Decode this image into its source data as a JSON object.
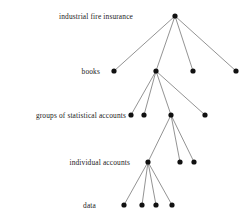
{
  "figure": {
    "type": "hierarchy-tree-diagram",
    "width": 244,
    "height": 221,
    "background_color": "#ffffff",
    "node_color": "#111111",
    "edge_color": "#4a4a4a"
  },
  "levels": [
    {
      "id": "level-1",
      "label": "industrial fire insurance",
      "label_x": 133,
      "label_y": 16
    },
    {
      "id": "level-2",
      "label": "books",
      "label_x": 100,
      "label_y": 71
    },
    {
      "id": "level-3",
      "label": "groups of statistical accounts",
      "label_x": 126,
      "label_y": 115
    },
    {
      "id": "level-4",
      "label": "individual accounts",
      "label_x": 130,
      "label_y": 162
    },
    {
      "id": "level-5",
      "label": "data",
      "label_x": 96,
      "label_y": 205
    }
  ],
  "nodes": [
    {
      "id": "n1-0",
      "level": 1,
      "x": 175,
      "y": 16,
      "r": 2.6
    },
    {
      "id": "n2-0",
      "level": 2,
      "x": 114,
      "y": 71,
      "r": 2.6
    },
    {
      "id": "n2-1",
      "level": 2,
      "x": 156,
      "y": 71,
      "r": 2.6
    },
    {
      "id": "n2-2",
      "level": 2,
      "x": 193,
      "y": 71,
      "r": 2.6
    },
    {
      "id": "n2-3",
      "level": 2,
      "x": 236,
      "y": 71,
      "r": 2.6
    },
    {
      "id": "n3-0",
      "level": 3,
      "x": 131,
      "y": 115,
      "r": 2.6
    },
    {
      "id": "n3-1",
      "level": 3,
      "x": 144,
      "y": 115,
      "r": 2.6
    },
    {
      "id": "n3-2",
      "level": 3,
      "x": 171,
      "y": 115,
      "r": 2.6
    },
    {
      "id": "n3-3",
      "level": 3,
      "x": 205,
      "y": 115,
      "r": 2.6
    },
    {
      "id": "n4-0",
      "level": 4,
      "x": 148,
      "y": 162,
      "r": 2.6
    },
    {
      "id": "n4-1",
      "level": 4,
      "x": 180,
      "y": 162,
      "r": 2.6
    },
    {
      "id": "n4-2",
      "level": 4,
      "x": 194,
      "y": 162,
      "r": 2.6
    },
    {
      "id": "n5-0",
      "level": 5,
      "x": 124,
      "y": 205,
      "r": 2.6
    },
    {
      "id": "n5-1",
      "level": 5,
      "x": 142,
      "y": 205,
      "r": 2.6
    },
    {
      "id": "n5-2",
      "level": 5,
      "x": 156,
      "y": 205,
      "r": 2.6
    },
    {
      "id": "n5-3",
      "level": 5,
      "x": 172,
      "y": 205,
      "r": 2.6
    }
  ],
  "edges": [
    {
      "from": "n1-0",
      "to": "n2-0"
    },
    {
      "from": "n1-0",
      "to": "n2-1"
    },
    {
      "from": "n1-0",
      "to": "n2-2"
    },
    {
      "from": "n1-0",
      "to": "n2-3"
    },
    {
      "from": "n2-1",
      "to": "n3-0"
    },
    {
      "from": "n2-1",
      "to": "n3-1"
    },
    {
      "from": "n2-1",
      "to": "n3-2"
    },
    {
      "from": "n2-1",
      "to": "n3-3"
    },
    {
      "from": "n3-2",
      "to": "n4-0"
    },
    {
      "from": "n3-2",
      "to": "n4-1"
    },
    {
      "from": "n3-2",
      "to": "n4-2"
    },
    {
      "from": "n4-0",
      "to": "n5-0"
    },
    {
      "from": "n4-0",
      "to": "n5-1"
    },
    {
      "from": "n4-0",
      "to": "n5-2"
    },
    {
      "from": "n4-0",
      "to": "n5-3"
    }
  ]
}
